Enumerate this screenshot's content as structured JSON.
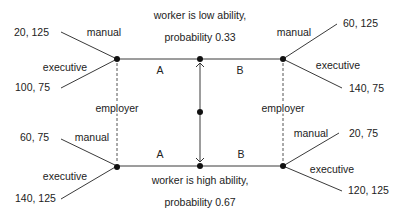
{
  "diagram": {
    "type": "signaling game tree",
    "nature": {
      "top_branch": {
        "line1": "worker is low ability,",
        "line2": "probability 0.33"
      },
      "bottom_branch": {
        "line1": "worker is high ability,",
        "line2": "probability 0.67"
      }
    },
    "worker_actions": {
      "left": "A",
      "right": "B"
    },
    "info_sets": {
      "left": "employer",
      "right": "employer"
    },
    "employer_actions": {
      "manual": "manual",
      "executive": "executive"
    },
    "payoffs": {
      "low_A_manual": "20, 125",
      "low_A_executive": "100, 75",
      "low_B_manual": "60, 125",
      "low_B_executive": "140, 75",
      "high_A_manual": "60, 75",
      "high_A_executive": "140, 125",
      "high_B_manual": "20, 75",
      "high_B_executive": "120, 125"
    }
  }
}
